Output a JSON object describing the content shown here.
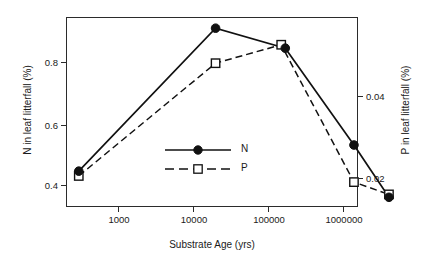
{
  "chart_data": {
    "type": "line",
    "title": "",
    "xlabel": "Substrate Age (yrs)",
    "ylabel": "N in leaf litterfall (%)",
    "y2label": "P in leaf litterfall (%)",
    "xscale": "log",
    "xlim": [
      200,
      6000000
    ],
    "ylim": [
      0.33,
      0.95
    ],
    "y2lim": [
      0.0145,
      0.056
    ],
    "grid": false,
    "legend_position": "center",
    "xticks": [
      1000,
      10000,
      100000,
      1000000
    ],
    "xticklabels": [
      "1000",
      "10000",
      "100000",
      "1000000"
    ],
    "yticks": [
      0.4,
      0.6,
      0.8
    ],
    "yticklabels": [
      "0.4",
      "0.6",
      "0.8"
    ],
    "y2ticks": [
      0.02,
      0.04
    ],
    "y2ticklabels": [
      "0.02",
      "0.04"
    ],
    "x": [
      300,
      20000,
      150000,
      170000,
      1400000,
      4100000
    ],
    "series": [
      {
        "name": "N",
        "axis": "left",
        "marker": "filled-circle",
        "linestyle": "solid",
        "color": "#111111",
        "x": [
          300,
          20000,
          170000,
          1400000,
          4100000
        ],
        "values": [
          0.445,
          0.91,
          0.845,
          0.53,
          0.36
        ]
      },
      {
        "name": "P",
        "axis": "right",
        "marker": "open-square",
        "linestyle": "dashed",
        "color": "#111111",
        "x": [
          300,
          20000,
          150000,
          1400000,
          4100000
        ],
        "values": [
          0.0205,
          0.048,
          0.0525,
          0.019,
          0.016
        ]
      }
    ],
    "legend": [
      {
        "label": "N",
        "marker": "filled-circle",
        "linestyle": "solid"
      },
      {
        "label": "P",
        "marker": "open-square",
        "linestyle": "dashed"
      }
    ]
  },
  "axes": {
    "x_title": "Substrate Age (yrs)",
    "y_left_title": "N in leaf litterfall (%)",
    "y_right_title": "P in leaf litterfall (%)",
    "x_ticks": [
      "1000",
      "10000",
      "100000",
      "1000000"
    ],
    "y_left_ticks": [
      "0.8",
      "0.6",
      "0.4"
    ],
    "y_right_ticks": [
      "0.04",
      "0.02"
    ]
  },
  "legend": {
    "n_label": "N",
    "p_label": "P"
  }
}
